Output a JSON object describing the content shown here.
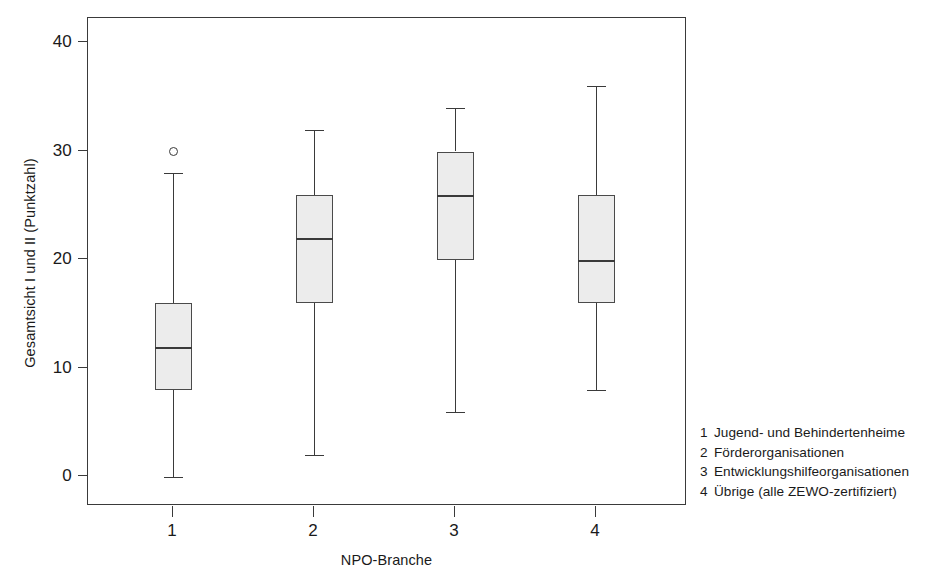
{
  "chart_data": {
    "type": "box",
    "title": "",
    "xlabel": "NPO-Branche",
    "ylabel": "Gesamtsicht I und II (Punktzahl)",
    "ylim": [
      0,
      43
    ],
    "yticks": [
      0,
      10,
      20,
      30,
      40
    ],
    "ytick_labels": [
      "0",
      "10",
      "20",
      "30",
      "40"
    ],
    "xticks": [
      1,
      2,
      3,
      4
    ],
    "xtick_labels": [
      "1",
      "2",
      "3",
      "4"
    ],
    "grid": false,
    "legend_position": "right-bottom",
    "categories": [
      "1",
      "2",
      "3",
      "4"
    ],
    "boxes": [
      {
        "category": "1",
        "name": "Jugend- und Behindertenheime",
        "whisker_low": 0,
        "q1": 8,
        "median": 12,
        "q3": 16,
        "whisker_high": 28,
        "outliers": [
          30
        ]
      },
      {
        "category": "2",
        "name": "Förderorganisationen",
        "whisker_low": 2,
        "q1": 16,
        "median": 22,
        "q3": 26,
        "whisker_high": 32,
        "outliers": []
      },
      {
        "category": "3",
        "name": "Entwicklungshilfeorganisationen",
        "whisker_low": 6,
        "q1": 20,
        "median": 26,
        "q3": 30,
        "whisker_high": 34,
        "outliers": []
      },
      {
        "category": "4",
        "name": "Übrige (alle ZEWO-zertifiziert)",
        "whisker_low": 8,
        "q1": 16,
        "median": 20,
        "q3": 26,
        "whisker_high": 36,
        "outliers": []
      }
    ],
    "colors": {
      "box_fill": "#ececec",
      "line": "#3a3a3a",
      "frame": "#3a3a3a",
      "text": "#1a1a1a"
    }
  },
  "legend": {
    "items": [
      {
        "key": "1",
        "label": "Jugend- und Behindertenheime"
      },
      {
        "key": "2",
        "label": "Förderorganisationen"
      },
      {
        "key": "3",
        "label": "Entwicklungshilfeorganisationen"
      },
      {
        "key": "4",
        "label": "Übrige (alle ZEWO-zertifiziert)"
      }
    ]
  }
}
